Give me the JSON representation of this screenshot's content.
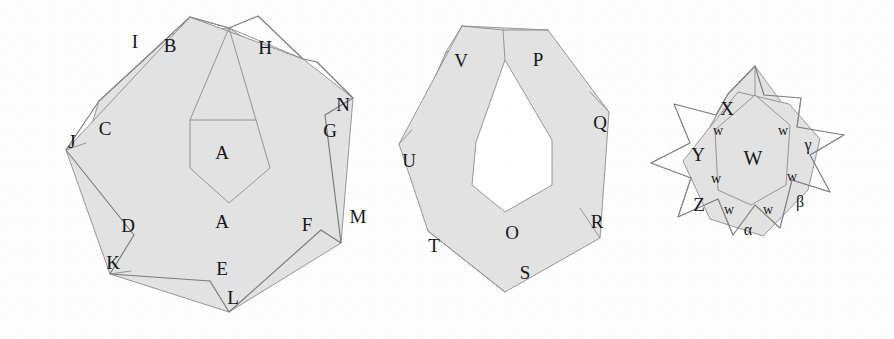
{
  "figure": {
    "background_color": "#fdfdfd",
    "fill_color": "#e2e2e2",
    "stroke_color": "#8b8b8b",
    "hole_color": "#ffffff",
    "label_color": "#15151a",
    "panel_count": 3
  },
  "panels": [
    {
      "name": "left-figure",
      "description": "Seven-pointed star formed by two overlapping heptagons; inner heptagonal core outlined and shaded",
      "inner_core_filled": true,
      "labels": [
        {
          "text": "I",
          "x": 135,
          "y": 44,
          "size": "size-major"
        },
        {
          "text": "B",
          "x": 170,
          "y": 48,
          "size": "size-major"
        },
        {
          "text": "H",
          "x": 265,
          "y": 50,
          "size": "size-major"
        },
        {
          "text": "N",
          "x": 343,
          "y": 107,
          "size": "size-major"
        },
        {
          "text": "C",
          "x": 105,
          "y": 131,
          "size": "size-major"
        },
        {
          "text": "J",
          "x": 72,
          "y": 144,
          "size": "size-major"
        },
        {
          "text": "G",
          "x": 330,
          "y": 133,
          "size": "size-major"
        },
        {
          "text": "A",
          "x": 222,
          "y": 155,
          "size": "size-major"
        },
        {
          "text": "A",
          "x": 222,
          "y": 224,
          "size": "size-major"
        },
        {
          "text": "D",
          "x": 128,
          "y": 228,
          "size": "size-major"
        },
        {
          "text": "F",
          "x": 307,
          "y": 227,
          "size": "size-major"
        },
        {
          "text": "M",
          "x": 358,
          "y": 219,
          "size": "size-major"
        },
        {
          "text": "K",
          "x": 113,
          "y": 265,
          "size": "size-major"
        },
        {
          "text": "E",
          "x": 222,
          "y": 271,
          "size": "size-major"
        },
        {
          "text": "L",
          "x": 233,
          "y": 300,
          "size": "size-major"
        }
      ]
    },
    {
      "name": "middle-figure",
      "description": "Two overlapping heptagons leaving an unshaded heptagonal hole at the centre",
      "inner_core_filled": false,
      "labels": [
        {
          "text": "V",
          "x": 461,
          "y": 63,
          "size": "size-major"
        },
        {
          "text": "P",
          "x": 538,
          "y": 62,
          "size": "size-major"
        },
        {
          "text": "Q",
          "x": 600,
          "y": 125,
          "size": "size-major"
        },
        {
          "text": "U",
          "x": 409,
          "y": 163,
          "size": "size-major"
        },
        {
          "text": "R",
          "x": 597,
          "y": 224,
          "size": "size-major"
        },
        {
          "text": "O",
          "x": 512,
          "y": 235,
          "size": "size-major"
        },
        {
          "text": "T",
          "x": 434,
          "y": 248,
          "size": "size-major"
        },
        {
          "text": "S",
          "x": 525,
          "y": 275,
          "size": "size-major"
        }
      ]
    },
    {
      "name": "right-figure",
      "description": "Small seven-pointed star; central core labelled W, points labelled X, Y, Z, alpha, beta, gamma and the small wedge regions all labelled w",
      "inner_core_filled": true,
      "labels": [
        {
          "text": "X",
          "x": 727,
          "y": 111,
          "size": "size-major"
        },
        {
          "text": "w",
          "x": 718,
          "y": 132,
          "size": "size-minor"
        },
        {
          "text": "w",
          "x": 783,
          "y": 132,
          "size": "size-minor"
        },
        {
          "text": "γ",
          "x": 808,
          "y": 146,
          "size": "size-greek"
        },
        {
          "text": "Y",
          "x": 698,
          "y": 157,
          "size": "size-major"
        },
        {
          "text": "W",
          "x": 753,
          "y": 160,
          "size": "size-center"
        },
        {
          "text": "w",
          "x": 716,
          "y": 180,
          "size": "size-minor"
        },
        {
          "text": "w",
          "x": 792,
          "y": 178,
          "size": "size-minor"
        },
        {
          "text": "Z",
          "x": 699,
          "y": 207,
          "size": "size-major"
        },
        {
          "text": "w",
          "x": 729,
          "y": 211,
          "size": "size-minor"
        },
        {
          "text": "w",
          "x": 768,
          "y": 211,
          "size": "size-minor"
        },
        {
          "text": "β",
          "x": 800,
          "y": 203,
          "size": "size-greek"
        },
        {
          "text": "α",
          "x": 748,
          "y": 231,
          "size": "size-greek"
        }
      ]
    }
  ],
  "geometry": {
    "left": {
      "heptagon_a": "229,28 330,95 325,219 131,271 86,143 99,101 172,34",
      "heptagon_b": "190,17 303,59 353,98 341,243 229,312 110,274 66,150",
      "star_outline": "229,28 258,16 303,59 317,62 353,98 325,115 341,243 321,230 229,312 210,281 110,274 134,235 66,150 99,101 190,17",
      "core": "190,120 256,120 270,168 229,203 190,168",
      "dividers": [
        "229,28 190,120",
        "229,28 256,120",
        "190,17 229,28",
        "229,28 303,59",
        "86,143 66,150",
        "99,101 190,17",
        "325,115 353,98",
        "341,243 321,230",
        "131,271 110,274",
        "229,312 210,281"
      ]
    },
    "middle": {
      "heptagon_a": "503,30 590,92 580,208 505,268 428,231 412,130 446,52",
      "heptagon_b": "462,26 548,30 609,112 600,238 505,292 428,231 399,144",
      "hole": "505,60 476,142 472,185 505,212 552,185 552,140",
      "dividers": [
        "503,30 505,60",
        "462,26 503,30",
        "503,30 548,30",
        "412,130 399,144",
        "446,52 462,26",
        "590,92 609,112",
        "580,208 600,238",
        "428,231 505,292"
      ]
    },
    "right": {
      "heptagon_a": "755,66 800,128 793,194 751,227 713,198 707,132 728,94",
      "heptagon_b": "738,92 789,104 820,139 808,190 763,236 710,219 683,161",
      "star_outline": "755,66 764,95 801,98 797,127 844,135 810,155 830,192 792,180 780,228 755,205 733,235 718,199 678,217 691,178 651,163 690,143 674,104 716,115 728,94",
      "core": "755,95 790,125 786,185 751,205 718,190 715,130",
      "dividers": [
        "755,66 755,95",
        "716,115 728,94",
        "801,98 797,127",
        "844,135 810,155",
        "830,192 792,180",
        "780,228 755,205",
        "733,235 718,199",
        "678,217 691,178",
        "651,163 690,143"
      ]
    }
  }
}
